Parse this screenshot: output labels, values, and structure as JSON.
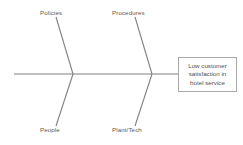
{
  "diagram": {
    "type": "fishbone-cause-and-effect",
    "colors": {
      "background": "#ffffff",
      "line": "#808080",
      "box_border": "#a8a8a8",
      "text": "#5a5a5a"
    },
    "spine": {
      "x1": 14,
      "y1": 74,
      "x2": 178,
      "y2": 74
    },
    "bones": [
      {
        "name": "policies",
        "label": "Policies",
        "position": "upper-left",
        "x1": 56,
        "y1": 17,
        "x2": 73,
        "y2": 74
      },
      {
        "name": "procedures",
        "label": "Procedures",
        "position": "upper-right",
        "x1": 135,
        "y1": 17,
        "x2": 152,
        "y2": 74
      },
      {
        "name": "people",
        "label": "People",
        "position": "lower-left",
        "x1": 56,
        "y1": 126,
        "x2": 73,
        "y2": 74
      },
      {
        "name": "plant-tech",
        "label": "Plant/Tech",
        "position": "lower-right",
        "x1": 135,
        "y1": 126,
        "x2": 152,
        "y2": 74
      }
    ],
    "effect": {
      "text": "Low customer satisfaction in hotel service",
      "line1": "Low customer",
      "line2": "satisfaction in",
      "line3": "hotel service"
    }
  }
}
